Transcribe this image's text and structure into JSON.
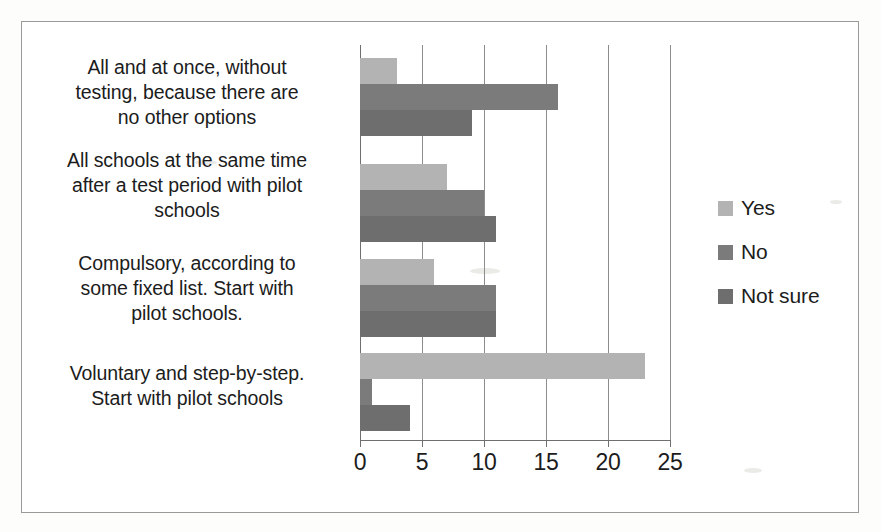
{
  "chart_data": {
    "type": "bar",
    "orientation": "horizontal",
    "title": "",
    "xlabel": "",
    "ylabel": "",
    "xlim": [
      0,
      25
    ],
    "xticks": [
      0,
      5,
      10,
      15,
      20,
      25
    ],
    "grid": true,
    "legend_position": "right",
    "categories": [
      "All and at once, without testing, because there are no other options",
      "All schools at the same time after a test period with pilot schools",
      "Compulsory, according to some fixed list. Start with pilot schools.",
      "Voluntary and step-by-step. Start with pilot schools"
    ],
    "series": [
      {
        "name": "Yes",
        "color": "#b3b3b3",
        "values": [
          3,
          7,
          6,
          23
        ]
      },
      {
        "name": "No",
        "color": "#7b7b7b",
        "values": [
          16,
          10,
          11,
          1
        ]
      },
      {
        "name": "Not sure",
        "color": "#6e6e6e",
        "values": [
          9,
          11,
          11,
          4
        ]
      }
    ]
  },
  "axis": {
    "tick_labels": [
      "0",
      "5",
      "10",
      "15",
      "20",
      "25"
    ]
  },
  "legend": {
    "entries": [
      {
        "label": "Yes"
      },
      {
        "label": "No"
      },
      {
        "label": "Not sure"
      }
    ]
  },
  "category_labels": [
    {
      "lines": [
        "All and at once, without",
        "testing, because there are",
        "no other options"
      ]
    },
    {
      "lines": [
        "All schools at the same time",
        "after a test period with pilot",
        "schools"
      ]
    },
    {
      "lines": [
        "Compulsory, according to",
        "some fixed list. Start with",
        "pilot schools."
      ]
    },
    {
      "lines": [
        "Voluntary and step-by-step.",
        "Start with pilot schools"
      ]
    }
  ]
}
